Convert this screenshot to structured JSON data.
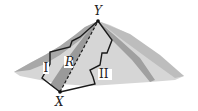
{
  "diagram": {
    "labels": {
      "summit": "Y",
      "base": "X",
      "path_one": "I",
      "path_two": "II",
      "region": "R"
    },
    "colors": {
      "mountain_light": "#d4d4d4",
      "mountain_mid": "#b0b0b0",
      "mountain_dark": "#8c8c8c",
      "path": "#1a1a1a",
      "label_bg": "#ffffff"
    }
  }
}
